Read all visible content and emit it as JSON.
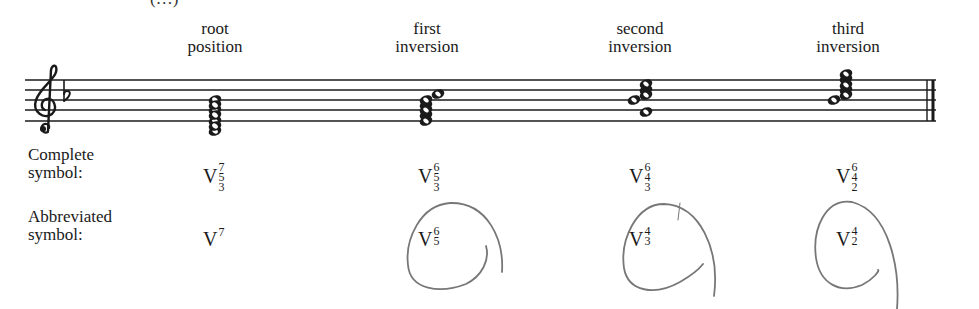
{
  "figure": {
    "top_cut_text": "(…)",
    "column_headers": [
      {
        "id": "root",
        "line1": "root",
        "line2": "position",
        "x": 215
      },
      {
        "id": "first",
        "line1": "first",
        "line2": "inversion",
        "x": 427
      },
      {
        "id": "second",
        "line1": "second",
        "line2": "inversion",
        "x": 640
      },
      {
        "id": "third",
        "line1": "third",
        "line2": "inversion",
        "x": 848
      }
    ],
    "staff": {
      "clef": "treble",
      "key_signature": "B-flat (1 flat)",
      "line_y": [
        80,
        90,
        100,
        110,
        121
      ],
      "x_start": 25,
      "x_end": 936,
      "final_barline": "double"
    },
    "row_labels": {
      "complete_line1": "Complete",
      "complete_line2": "symbol:",
      "abbreviated_line1": "Abbreviated",
      "abbreviated_line2": "symbol:"
    },
    "complete_symbols": [
      {
        "numeral": "V",
        "figures": [
          "7",
          "5",
          "3"
        ]
      },
      {
        "numeral": "V",
        "figures": [
          "6",
          "5",
          "3"
        ]
      },
      {
        "numeral": "V",
        "figures": [
          "6",
          "4",
          "3"
        ]
      },
      {
        "numeral": "V",
        "figures": [
          "6",
          "4",
          "2"
        ]
      }
    ],
    "abbreviated_symbols": [
      {
        "numeral": "V",
        "figures": [
          "7"
        ],
        "circled": false
      },
      {
        "numeral": "V",
        "figures": [
          "6",
          "5"
        ],
        "circled": true
      },
      {
        "numeral": "V",
        "figures": [
          "4",
          "3"
        ],
        "circled": true
      },
      {
        "numeral": "V",
        "figures": [
          "4",
          "2"
        ],
        "circled": true
      }
    ],
    "annotation_color": "#777777",
    "ink_color": "#1a1a1a"
  }
}
